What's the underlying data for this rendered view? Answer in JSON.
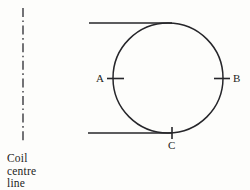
{
  "diagram": {
    "background_color": "#fdfdfb",
    "ink_color": "#26262a",
    "centre_line": {
      "caption_line_1": "Coil",
      "caption_line_2": "centre",
      "caption_line_3": "line",
      "style": "dash-dot",
      "x": 23,
      "y_start": 8,
      "y_end": 141
    },
    "coil_circle": {
      "center_x": 168,
      "center_y": 78,
      "radius": 55
    },
    "tangent_lines": [
      {
        "name": "upper-tangent-line",
        "x_start": 89,
        "x_end": 172,
        "y": 23
      },
      {
        "name": "lower-tangent-line",
        "x_start": 88,
        "x_end": 172,
        "y": 133
      }
    ],
    "points": [
      {
        "id": "A",
        "label": "A",
        "x": 115,
        "y": 78,
        "tick": "horizontal"
      },
      {
        "id": "B",
        "label": "B",
        "x": 222,
        "y": 78,
        "tick": "horizontal"
      },
      {
        "id": "C",
        "label": "C",
        "x": 172,
        "y": 133,
        "tick": "vertical"
      }
    ]
  }
}
